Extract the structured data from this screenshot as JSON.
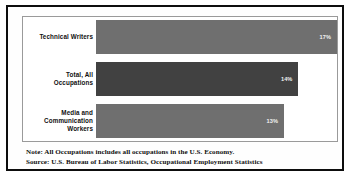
{
  "chart_data": {
    "type": "bar",
    "orientation": "horizontal",
    "title": "",
    "xlabel": "",
    "ylabel": "",
    "categories": [
      "Technical Writers",
      "Total, All Occupations",
      "Media and Communication Workers"
    ],
    "values": [
      17,
      14,
      13
    ],
    "value_labels": [
      "17%",
      "14%",
      "13%"
    ],
    "value_unit": "%",
    "xlim": [
      0,
      17
    ],
    "grid": false,
    "legend": "none",
    "series": [
      {
        "name": "Projected percent change in employment, 2016-26",
        "values": [
          17,
          14,
          13
        ]
      }
    ],
    "bar_colors": [
      "#6f6f6f",
      "#414141",
      "#6f6f6f"
    ]
  },
  "bars": [
    {
      "label": "Technical Writers",
      "value_label": "17%",
      "value": 17,
      "width_pct": 100,
      "color_variant": "light"
    },
    {
      "label": "Total, All\nOccupations",
      "value_label": "14%",
      "value": 14,
      "width_pct": 84,
      "color_variant": "dark"
    },
    {
      "label": "Media and\nCommunication\nWorkers",
      "value_label": "13%",
      "value": 13,
      "width_pct": 78,
      "color_variant": "light"
    }
  ],
  "footnotes": {
    "note": "Note: All Occupations includes all occupations in the U.S. Economy.",
    "source": "Source: U.S. Bureau of Labor Statistics, Occupational Employment Statistics"
  }
}
